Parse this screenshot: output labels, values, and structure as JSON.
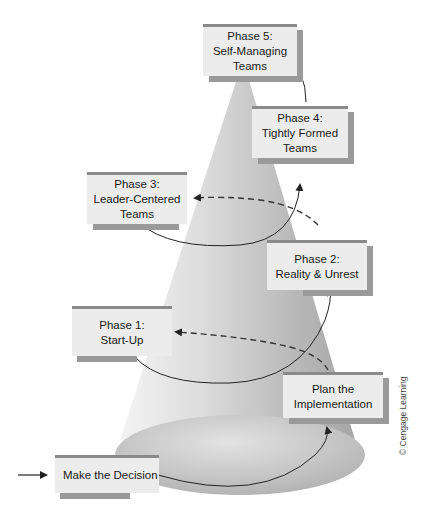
{
  "diagram": {
    "colors": {
      "cone_light": "#e8e8e8",
      "cone_dark": "#a8a8a8",
      "box_face": "#ececec",
      "box_shadow": "#9a9a9a",
      "box_top_border": "#8a8a8a",
      "arrow": "#222222"
    },
    "nodes": [
      {
        "id": "make-decision",
        "label": "Make the Decision"
      },
      {
        "id": "plan-implementation",
        "label": "Plan the\nImplementation"
      },
      {
        "id": "phase1",
        "label": "Phase 1:\nStart-Up"
      },
      {
        "id": "phase2",
        "label": "Phase 2:\nReality & Unrest"
      },
      {
        "id": "phase3",
        "label": "Phase 3:\nLeader-Centered\nTeams"
      },
      {
        "id": "phase4",
        "label": "Phase 4:\nTightly Formed\nTeams"
      },
      {
        "id": "phase5",
        "label": "Phase 5:\nSelf-Managing\nTeams"
      }
    ],
    "edges": [
      {
        "from": "external",
        "to": "make-decision",
        "style": "solid"
      },
      {
        "from": "make-decision",
        "to": "plan-implementation",
        "style": "solid"
      },
      {
        "from": "plan-implementation",
        "to": "phase1",
        "style": "dashed"
      },
      {
        "from": "plan-implementation",
        "to": "phase2",
        "style": "solid"
      },
      {
        "from": "phase2",
        "to": "phase3",
        "style": "dashed"
      },
      {
        "from": "phase3",
        "to": "phase4",
        "style": "solid"
      },
      {
        "from": "phase4",
        "to": "phase5",
        "style": "solid"
      }
    ],
    "credit": "© Cengage Learning"
  }
}
